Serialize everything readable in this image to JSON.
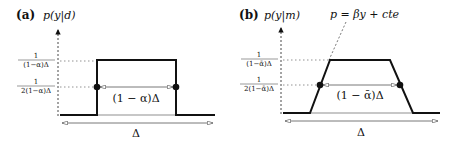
{
  "panels": [
    {
      "tag": "(a)",
      "ylabel": "p(y|d)",
      "tick_top": {
        "num": "1",
        "den": "(1−α)Δ"
      },
      "tick_half": {
        "num": "1",
        "den": "2(1−α)Δ"
      },
      "width_label": "(1 − α)Δ",
      "support_label": "Δ",
      "shape": "rectangle"
    },
    {
      "tag": "(b)",
      "ylabel": "p(y|m)",
      "tick_top": {
        "num": "1",
        "den": "(1−ᾱ)Δ"
      },
      "tick_half": {
        "num": "1",
        "den": "2(1−ᾱ)Δ"
      },
      "width_label": "(1 − ᾱ)Δ",
      "support_label": "Δ",
      "shape": "trapezoid",
      "slope_annotation": "p = βy + cte"
    }
  ],
  "colors": {
    "line": "#111111",
    "guide": "#777777",
    "arrow": "#555555"
  }
}
